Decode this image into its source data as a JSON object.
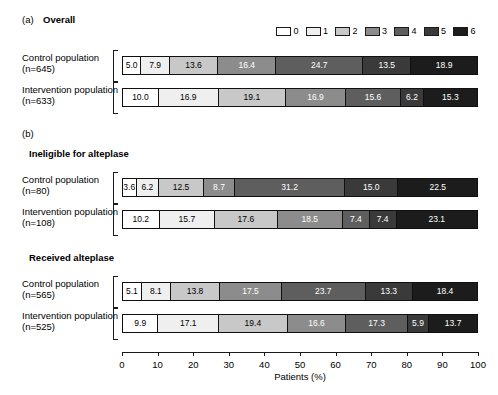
{
  "panels": [
    {
      "tag": "(a)",
      "title": "Overall"
    },
    {
      "tag": "(b)",
      "title": ""
    }
  ],
  "groups": [
    {
      "title": "Ineligible for alteplase"
    },
    {
      "title": "Received alteplase"
    }
  ],
  "legend": {
    "title": "",
    "entries": [
      {
        "label": "0",
        "color": "#ffffff"
      },
      {
        "label": "1",
        "color": "#efefef"
      },
      {
        "label": "2",
        "color": "#c8c8c8"
      },
      {
        "label": "3",
        "color": "#8c8c8c"
      },
      {
        "label": "4",
        "color": "#5e5e5e"
      },
      {
        "label": "5",
        "color": "#3a3a3a"
      },
      {
        "label": "6",
        "color": "#1c1c1c"
      }
    ]
  },
  "chart_data": {
    "type": "bar",
    "orientation": "horizontal",
    "stacked": true,
    "xlabel": "Patients (%)",
    "ylabel": "",
    "xlim": [
      0,
      100
    ],
    "xticks": [
      0,
      10,
      20,
      30,
      40,
      50,
      60,
      70,
      80,
      90,
      100
    ],
    "grid": false,
    "legend_position": "top-right",
    "categories": [
      "0",
      "1",
      "2",
      "3",
      "4",
      "5",
      "6"
    ],
    "colors": [
      "#ffffff",
      "#efefef",
      "#c8c8c8",
      "#8c8c8c",
      "#5e5e5e",
      "#3a3a3a",
      "#1c1c1c"
    ],
    "label_colors": [
      "#000000",
      "#000000",
      "#000000",
      "#ffffff",
      "#ffffff",
      "#ffffff",
      "#ffffff"
    ],
    "panels": [
      {
        "tag": "(a)",
        "title": "Overall",
        "series": [
          {
            "name": "Control population",
            "n_label": "(n=645)",
            "values": [
              5.0,
              7.9,
              13.6,
              16.4,
              24.7,
              13.5,
              18.9
            ],
            "labels": [
              "5.0",
              "7.9",
              "13.6",
              "16.4",
              "24.7",
              "13.5",
              "18.9"
            ]
          },
          {
            "name": "Intervention population",
            "n_label": "(n=633)",
            "values": [
              10.0,
              16.9,
              19.1,
              16.9,
              15.6,
              6.2,
              15.3
            ],
            "labels": [
              "10.0",
              "16.9",
              "19.1",
              "16.9",
              "15.6",
              "6.2",
              "15.3"
            ]
          }
        ]
      },
      {
        "tag": "(b)",
        "title": "Ineligible for alteplase",
        "series": [
          {
            "name": "Control population",
            "n_label": "(n=80)",
            "values": [
              3.6,
              6.2,
              12.5,
              8.7,
              31.2,
              15.0,
              22.5
            ],
            "labels": [
              "3.6",
              "6.2",
              "12.5",
              "8.7",
              "31.2",
              "15.0",
              "22.5"
            ]
          },
          {
            "name": "Intervention population",
            "n_label": "(n=108)",
            "values": [
              10.2,
              15.7,
              17.6,
              18.5,
              7.4,
              7.4,
              23.1
            ],
            "labels": [
              "10.2",
              "15.7",
              "17.6",
              "18.5",
              "7.4",
              "7.4",
              "23.1"
            ]
          }
        ]
      },
      {
        "tag": "",
        "title": "Received alteplase",
        "series": [
          {
            "name": "Control population",
            "n_label": "(n=565)",
            "values": [
              5.1,
              8.1,
              13.8,
              17.5,
              23.7,
              13.3,
              18.4
            ],
            "labels": [
              "5.1",
              "8.1",
              "13.8",
              "17.5",
              "23.7",
              "13.3",
              "18.4"
            ]
          },
          {
            "name": "Intervention population",
            "n_label": "(n=525)",
            "values": [
              9.9,
              17.1,
              19.4,
              16.6,
              17.3,
              5.9,
              13.7
            ],
            "labels": [
              "9.9",
              "17.1",
              "19.4",
              "16.6",
              "17.3",
              "5.9",
              "13.7"
            ]
          }
        ]
      }
    ]
  },
  "axis": {
    "title": "Patients (%)",
    "ticks": [
      "0",
      "10",
      "20",
      "30",
      "40",
      "50",
      "60",
      "70",
      "80",
      "90",
      "100"
    ]
  }
}
